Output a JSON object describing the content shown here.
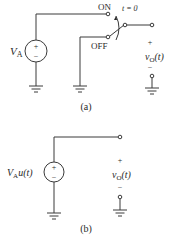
{
  "figure_a": {
    "caption": "(a)",
    "source_label": "V",
    "source_sub": "A",
    "source_plus": "+",
    "source_minus": "−",
    "switch_on_label": "ON",
    "switch_off_label": "OFF",
    "switch_time": "t = 0",
    "output_plus": "+",
    "output_label": "v",
    "output_sub": "O",
    "output_arg": "(t)",
    "output_minus": "−"
  },
  "figure_b": {
    "caption": "(b)",
    "source_label": "V",
    "source_sub": "A",
    "source_suffix": "u(t)",
    "source_plus": "+",
    "source_minus": "−",
    "output_plus": "+",
    "output_label": "v",
    "output_sub": "O",
    "output_arg": "(t)",
    "output_minus": "−"
  }
}
